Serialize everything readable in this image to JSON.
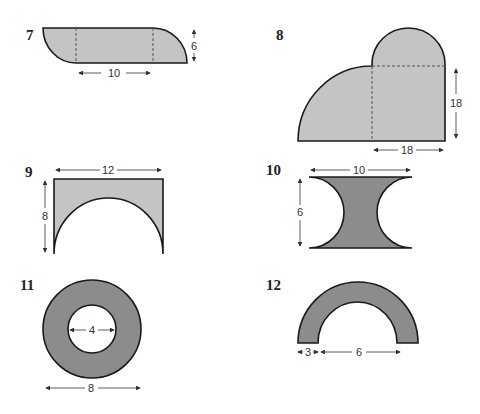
{
  "figures": [
    {
      "number": "7",
      "dimensions": {
        "width": "10",
        "height": "6"
      },
      "description": "rectangle with two quarter-circle ends, dashed dividers"
    },
    {
      "number": "8",
      "dimensions": {
        "width": "18",
        "height": "18"
      },
      "description": "square with quarter circle on left and semicircle on top"
    },
    {
      "number": "9",
      "dimensions": {
        "width": "12",
        "height": "8"
      },
      "description": "rectangle with semicircle removed from bottom"
    },
    {
      "number": "10",
      "dimensions": {
        "width": "10",
        "height": "6"
      },
      "description": "rectangle with two semicircles removed from sides"
    },
    {
      "number": "11",
      "dimensions": {
        "inner_diameter": "4",
        "outer_diameter": "8"
      },
      "description": "annulus"
    },
    {
      "number": "12",
      "dimensions": {
        "thickness": "3",
        "inner_diameter": "6"
      },
      "description": "half annulus"
    }
  ],
  "colors": {
    "light_fill": "#c4c4c4",
    "dark_fill": "#8c8c8c",
    "stroke": "#1a1a1a"
  }
}
